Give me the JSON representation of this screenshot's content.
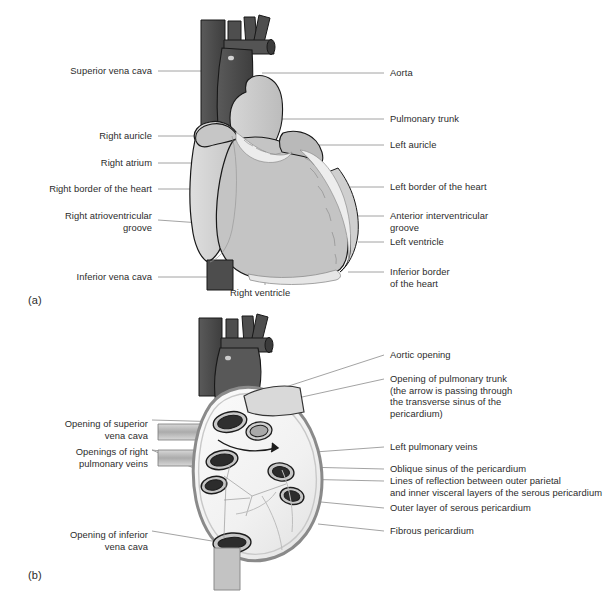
{
  "figure": {
    "panel_a": {
      "caption": "(a)",
      "left_labels": [
        {
          "text": "Superior vena cava",
          "y": 71
        },
        {
          "text": "Right auricle",
          "y": 136
        },
        {
          "text": "Right atrium",
          "y": 163
        },
        {
          "text": "Right border of the heart",
          "y": 189
        },
        {
          "text": "Right atrioventricular\ngroove",
          "y": 216
        },
        {
          "text": "Inferior vena cava",
          "y": 277
        }
      ],
      "right_labels": [
        {
          "text": "Aorta",
          "y": 73
        },
        {
          "text": "Pulmonary trunk",
          "y": 119
        },
        {
          "text": "Left auricle",
          "y": 145
        },
        {
          "text": "Left border of the heart",
          "y": 187
        },
        {
          "text": "Anterior interventricular\ngroove",
          "y": 216
        },
        {
          "text": "Left ventricle",
          "y": 242
        },
        {
          "text": "Inferior border\nof the heart",
          "y": 272
        }
      ],
      "bottom_labels": [
        {
          "text": "Right ventricle",
          "x": 230,
          "y": 292
        }
      ]
    },
    "panel_b": {
      "caption": "(b)",
      "left_labels": [
        {
          "text": "Opening of superior\nvena cava",
          "y": 424
        },
        {
          "text": "Openings of right\npulmonary veins",
          "y": 452
        },
        {
          "text": "Opening of inferior\nvena cava",
          "y": 535
        }
      ],
      "right_labels": [
        {
          "text": "Aortic opening",
          "y": 355
        },
        {
          "text": "Opening of pulmonary trunk\n(the arrow is passing through\nthe transverse sinus of the\npericardium)",
          "y": 379
        },
        {
          "text": "Left pulmonary veins",
          "y": 447
        },
        {
          "text": "Oblique sinus of the pericardium",
          "y": 469
        },
        {
          "text": "Lines of reflection between outer parietal\nand inner visceral layers of the serous pericardium",
          "y": 481
        },
        {
          "text": "Outer layer of serous pericardium",
          "y": 508
        },
        {
          "text": "Fibrous pericardium",
          "y": 531
        }
      ]
    },
    "colors": {
      "vessel_dark": "#4a4a4a",
      "vessel_mid": "#5e5e5e",
      "heart_light": "#c9c9c9",
      "heart_pale": "#d5d5d5",
      "fat_white": "#ededed",
      "outline": "#1a1a1a",
      "leader": "#8b8b8b",
      "background": "#ffffff",
      "pericardium_pale": "#f0f0f0",
      "pericardium_grey": "#b8b8b8"
    }
  }
}
